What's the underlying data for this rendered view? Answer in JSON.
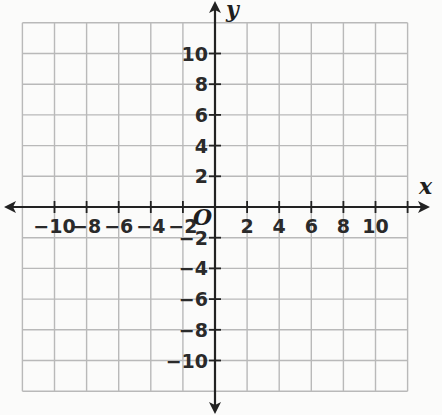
{
  "chart_data": {
    "type": "scatter",
    "title": "",
    "xlabel": "x",
    "ylabel": "y",
    "origin_label": "O",
    "xlim": [
      -12,
      12
    ],
    "ylim": [
      -12,
      12
    ],
    "grid": true,
    "grid_step": 2,
    "x_ticks": [
      -10,
      -8,
      -6,
      -4,
      -2,
      2,
      4,
      6,
      8,
      10
    ],
    "y_ticks": [
      -10,
      -8,
      -6,
      -4,
      -2,
      2,
      4,
      6,
      8,
      10
    ],
    "x_tick_labels": [
      "−10",
      "−8",
      "−6",
      "−4",
      "−2",
      "2",
      "4",
      "6",
      "8",
      "10"
    ],
    "y_tick_labels": [
      "−10",
      "−8",
      "−6",
      "−4",
      "−2",
      "2",
      "4",
      "6",
      "8",
      "10"
    ],
    "series": [],
    "legend": null
  },
  "colors": {
    "grid": "#b9b9b9",
    "axis": "#222222",
    "text": "#2a2a2a",
    "background": "#fbfbfa"
  }
}
